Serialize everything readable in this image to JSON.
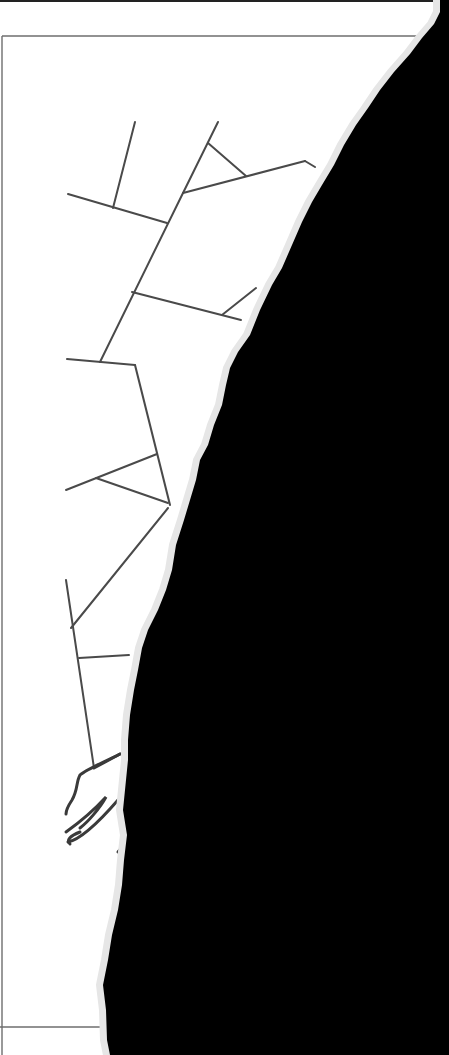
{
  "image": {
    "description": "Scanned page with a hand-drawn branching line diagram, right side torn away revealing black background",
    "width": 449,
    "height": 1055
  },
  "colors": {
    "paper": "#ffffff",
    "background": "#000000",
    "line": "#4a4a4a",
    "frame": "#6e6e6e",
    "torn_edge": "#e6e6e6"
  },
  "drawing": {
    "frame_lines": [
      {
        "x1": 2,
        "y1": 36,
        "x2": 420,
        "y2": 36
      },
      {
        "x1": 2,
        "y1": 36,
        "x2": 2,
        "y2": 1055
      },
      {
        "x1": 0,
        "y1": 1027,
        "x2": 110,
        "y2": 1027
      }
    ],
    "segments": [
      {
        "x1": 135,
        "y1": 122,
        "x2": 113,
        "y2": 208
      },
      {
        "x1": 68,
        "y1": 194,
        "x2": 167,
        "y2": 223
      },
      {
        "x1": 218,
        "y1": 122,
        "x2": 183,
        "y2": 193
      },
      {
        "x1": 208,
        "y1": 143,
        "x2": 246,
        "y2": 176
      },
      {
        "x1": 183,
        "y1": 193,
        "x2": 305,
        "y2": 161
      },
      {
        "x1": 305,
        "y1": 161,
        "x2": 315,
        "y2": 167
      },
      {
        "x1": 183,
        "y1": 193,
        "x2": 100,
        "y2": 362
      },
      {
        "x1": 132,
        "y1": 292,
        "x2": 241,
        "y2": 320
      },
      {
        "x1": 222,
        "y1": 315,
        "x2": 256,
        "y2": 288
      },
      {
        "x1": 67,
        "y1": 359,
        "x2": 135,
        "y2": 365
      },
      {
        "x1": 135,
        "y1": 365,
        "x2": 170,
        "y2": 505
      },
      {
        "x1": 66,
        "y1": 490,
        "x2": 157,
        "y2": 454
      },
      {
        "x1": 96,
        "y1": 478,
        "x2": 168,
        "y2": 503
      },
      {
        "x1": 168,
        "y1": 508,
        "x2": 71,
        "y2": 628
      },
      {
        "x1": 66,
        "y1": 580,
        "x2": 94,
        "y2": 768
      },
      {
        "x1": 79,
        "y1": 658,
        "x2": 129,
        "y2": 655
      }
    ],
    "hand_strokes": [
      "M 94 768 L 120 754",
      "M 120 754 C 100 764 85 770 80 775 C 76 782 78 790 72 800 C 68 806 66 810 66 814",
      "M 66 832 C 80 822 96 808 106 797 C 100 808 88 822 80 828",
      "M 68 842 C 78 840 92 830 118 800",
      "M 70 844 C 66 840 70 836 80 832",
      "M 118 852 C 121 848 124 846 126 846"
    ],
    "torn_region_path": "M 440 0 L 449 0 L 449 1055 L 110 1055 L 107 1040 L 106 1010 L 103 985 L 108 960 L 112 935 L 118 910 L 122 885 L 124 860 L 127 835 L 123 810 L 126 780 L 128 760 L 128 740 L 130 715 L 134 690 L 138 670 L 142 648 L 148 630 L 158 610 L 166 590 L 172 570 L 176 545 L 184 520 L 190 500 L 196 480 L 200 460 L 208 445 L 214 425 L 222 405 L 226 385 L 230 368 L 238 352 L 250 335 L 260 310 L 272 285 L 282 268 L 292 245 L 302 222 L 312 202 L 322 185 L 334 165 L 344 145 L 356 125 L 368 108 L 380 90 L 394 72 L 410 54 L 422 38 L 434 24 L 440 12 Z"
  }
}
